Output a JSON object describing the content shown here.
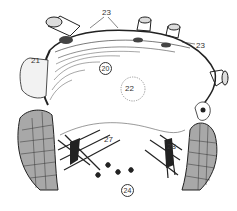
{
  "figure": {
    "type": "anatomical-illustration",
    "colors": {
      "ink": "#222222",
      "muscle": "#a8a8a8",
      "background": "#ffffff"
    },
    "labels": [
      {
        "id": "l20",
        "text": "20",
        "circled": true
      },
      {
        "id": "l21",
        "text": "21",
        "circled": false
      },
      {
        "id": "l22",
        "text": "22",
        "circled": false
      },
      {
        "id": "l23a",
        "text": "23",
        "circled": false
      },
      {
        "id": "l23b",
        "text": "23",
        "circled": false
      },
      {
        "id": "l24",
        "text": "24",
        "circled": true
      },
      {
        "id": "l27",
        "text": "27",
        "circled": false
      },
      {
        "id": "l28",
        "text": "28",
        "circled": false
      }
    ]
  }
}
